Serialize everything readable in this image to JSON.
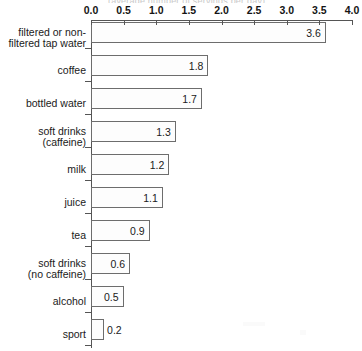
{
  "chart_data": {
    "type": "bar",
    "orientation": "horizontal",
    "title": "(average number of servings per day)",
    "xlabel": "",
    "ylabel": "",
    "xlim": [
      0.0,
      4.0
    ],
    "xticks": [
      "0.0",
      "0.5",
      "1.0",
      "1.5",
      "2.0",
      "2.5",
      "3.0",
      "3.5",
      "4.0"
    ],
    "xtick_values": [
      0.0,
      0.5,
      1.0,
      1.5,
      2.0,
      2.5,
      3.0,
      3.5,
      4.0
    ],
    "grid": false,
    "legend": "none",
    "categories": [
      "filtered or non-\nfiltered tap water",
      "coffee",
      "bottled water",
      "soft drinks\n(caffeine)",
      "milk",
      "juice",
      "tea",
      "soft drinks\n(no caffeine)",
      "alcohol",
      "sport"
    ],
    "values": [
      3.6,
      1.8,
      1.7,
      1.3,
      1.2,
      1.1,
      0.9,
      0.6,
      0.5,
      0.2
    ],
    "value_labels": [
      "3.6",
      "1.8",
      "1.7",
      "1.3",
      "1.2",
      "1.1",
      "0.9",
      "0.6",
      "0.5",
      "0.2"
    ],
    "label_placement": [
      "inside",
      "inside",
      "inside",
      "inside",
      "inside",
      "inside",
      "inside",
      "inside",
      "inside",
      "outside"
    ],
    "colors": {
      "bar_fill": "#fdfdfd",
      "bar_border": "#6d6d6d",
      "axis": "#555555",
      "text": "#1a1a1a",
      "background": "#ffffff"
    }
  }
}
